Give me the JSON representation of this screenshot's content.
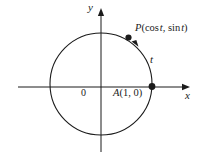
{
  "figure": {
    "background_color": "#ffffff",
    "stroke_color": "#1b1b1b",
    "axes": {
      "x_label": "x",
      "y_label": "y",
      "origin_label": "0",
      "x_axis": {
        "start_px": [
          18,
          87
        ],
        "end_px": [
          190,
          87
        ],
        "arrow": "end"
      },
      "y_axis": {
        "start_px": [
          101,
          152
        ],
        "end_px": [
          101,
          8
        ],
        "arrow": "end"
      }
    },
    "circle": {
      "center_px": [
        101,
        84
      ],
      "radius_px": 51,
      "center_value": [
        0,
        0
      ],
      "radius_value": 1
    },
    "points": [
      {
        "name": "point-p",
        "label": "P(cos t, sin t)",
        "label_parts": {
          "letter": "P",
          "open": "(",
          "cos": "cos",
          "param1": "t",
          "comma": ", ",
          "sin": "sin",
          "param2": "t",
          "close": ")"
        },
        "position_px": [
          128,
          38
        ],
        "marker": "filled-dot"
      },
      {
        "name": "point-a",
        "label": "A(1, 0)",
        "label_parts": {
          "letter": "A",
          "open": "(",
          "x": "1",
          "comma": ", ",
          "y": "0",
          "close": ")"
        },
        "position_px": [
          152,
          87
        ],
        "value": [
          1,
          0
        ],
        "marker": "filled-dot"
      }
    ],
    "arc": {
      "name": "arc-t",
      "label": "t",
      "direction": "counterclockwise",
      "from_point": "A(1, 0)",
      "to_point": "P(cos t, sin t)",
      "arrow": "counterclockwise-arrowhead"
    }
  }
}
